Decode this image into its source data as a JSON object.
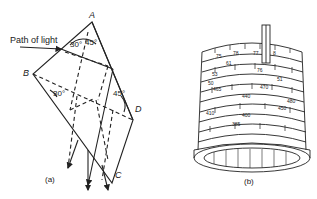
{
  "figure_a": {
    "caption": "(a)",
    "path_label": "Path of light",
    "vertices": {
      "A": "A",
      "B": "B",
      "C": "C",
      "D": "D"
    },
    "angles": {
      "top_left": "30°",
      "top_right": "45°",
      "left": "30°",
      "right": "45°"
    }
  },
  "figure_b": {
    "caption": "(b)",
    "scale_numbers": [
      "75",
      "78",
      "77",
      "8",
      "61",
      "76",
      "53",
      "51",
      "50",
      "470",
      "465",
      "440",
      "480",
      "410",
      "450",
      "400",
      "385"
    ]
  },
  "colors": {
    "ink": "#222222",
    "background": "#ffffff"
  }
}
